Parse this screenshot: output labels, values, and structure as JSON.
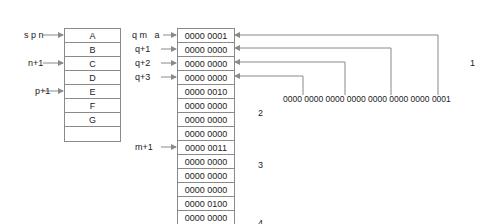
{
  "left_table": {
    "cells": [
      "A",
      "B",
      "C",
      "D",
      "E",
      "F",
      "G",
      ""
    ],
    "pointers": [
      {
        "label": "s p n",
        "row": 0
      },
      {
        "label": "n+1",
        "row": 2
      },
      {
        "label": "p+1",
        "row": 4
      }
    ]
  },
  "right_table": {
    "cells": [
      "0000 0001",
      "0000 0000",
      "0000 0000",
      "0000 0000",
      "0000 0010",
      "0000 0000",
      "0000 0000",
      "0000 0000",
      "0000 0011",
      "0000 0000",
      "0000 0000",
      "0000 0000",
      "0000 0100",
      "0000 0000"
    ],
    "pointers": [
      {
        "label": "q m   a",
        "row": 0
      },
      {
        "label": "q+1",
        "row": 1
      },
      {
        "label": "q+2",
        "row": 2
      },
      {
        "label": "q+3",
        "row": 3
      },
      {
        "label": "m+1",
        "row": 8
      }
    ]
  },
  "binary_value": "0000 0000 0000 0000 0000 0000 0000 0001",
  "group_labels": [
    {
      "text": "1"
    },
    {
      "text": "2"
    },
    {
      "text": "3"
    },
    {
      "text": "4"
    }
  ],
  "colors": {
    "line": "#8a8a8a",
    "text": "#222222"
  }
}
